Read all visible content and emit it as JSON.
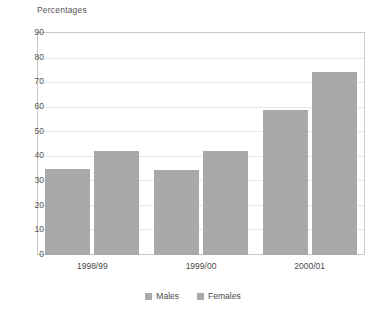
{
  "chart_data": {
    "type": "bar",
    "title": "Percentages",
    "xlabel": "",
    "ylabel": "Percentages",
    "categories": [
      "1998/99",
      "1999/00",
      "2000/01"
    ],
    "series": [
      {
        "name": "Males",
        "values": [
          35,
          34.5,
          59
        ],
        "color": "#a9a9a9"
      },
      {
        "name": "Females",
        "values": [
          42.5,
          42.5,
          74.5
        ],
        "color": "#a9a9a9"
      }
    ],
    "ylim": [
      0,
      90
    ],
    "yticks": [
      0,
      10,
      20,
      30,
      40,
      50,
      60,
      70,
      80,
      90
    ],
    "ytick_labels": [
      "0",
      "10",
      "20",
      "30",
      "40",
      "50",
      "60",
      "70",
      "80",
      "90"
    ],
    "grid": true,
    "legend_position": "bottom",
    "legend_entries": [
      "Males",
      "Females"
    ],
    "background_color": "#ffffff",
    "grid_color": "#e8e8e8",
    "frame_color": "#c9c9c9"
  }
}
